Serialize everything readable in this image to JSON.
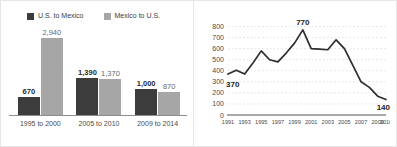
{
  "theme": {
    "series_dark": "#3c3c3c",
    "series_light": "#a6a6a6",
    "line_color": "#2e2e2e",
    "grid_color": "#cfcfcf",
    "axis_color": "#8d8d8d",
    "panel_background": "#ffffff",
    "page_background": "#fbfbfb"
  },
  "bar_panel": {
    "legend": [
      {
        "label": "U.S. to Mexico",
        "swatch": "dark",
        "color": "#3c3c3c"
      },
      {
        "label": "Mexico to U.S.",
        "swatch": "light",
        "color": "#a6a6a6"
      }
    ]
  },
  "line_panel": {
    "peak_label": "770",
    "start_label": "370",
    "end_label": "140"
  },
  "chart_data": [
    {
      "type": "bar",
      "title": "",
      "xlabel": "",
      "ylabel": "",
      "grid": false,
      "legend_position": "top-left",
      "categories": [
        "1995 to 2000",
        "2005 to 2010",
        "2009 to 2014"
      ],
      "ylim": [
        0,
        3000
      ],
      "series": [
        {
          "name": "U.S. to Mexico",
          "color": "#3c3c3c",
          "values": [
            670,
            1390,
            1000
          ],
          "labels": [
            "670",
            "1,390",
            "1,000"
          ]
        },
        {
          "name": "Mexico to U.S.",
          "color": "#a6a6a6",
          "values": [
            2940,
            1370,
            870
          ],
          "labels": [
            "2,940",
            "1,370",
            "870"
          ]
        }
      ]
    },
    {
      "type": "line",
      "title": "",
      "xlabel": "",
      "ylabel": "",
      "grid": true,
      "legend_position": "none",
      "x": [
        1991,
        1992,
        1993,
        1994,
        1995,
        1996,
        1997,
        1998,
        1999,
        2000,
        2001,
        2002,
        2003,
        2004,
        2005,
        2006,
        2007,
        2008,
        2009,
        2010
      ],
      "xticks": [
        "1991",
        "1993",
        "1995",
        "1997",
        "1999",
        "2001",
        "2003",
        "2005",
        "2007",
        "2009",
        "2010"
      ],
      "yticks": [
        "0",
        "100",
        "200",
        "300",
        "400",
        "500",
        "600",
        "700",
        "800"
      ],
      "ylim": [
        0,
        850
      ],
      "values": [
        370,
        405,
        370,
        470,
        580,
        500,
        480,
        560,
        650,
        770,
        600,
        595,
        590,
        680,
        600,
        450,
        300,
        250,
        170,
        140
      ],
      "annotations": [
        {
          "text": "370",
          "x": 1991,
          "y": 370
        },
        {
          "text": "770",
          "x": 2000,
          "y": 770
        },
        {
          "text": "140",
          "x": 2010,
          "y": 140
        }
      ]
    }
  ]
}
